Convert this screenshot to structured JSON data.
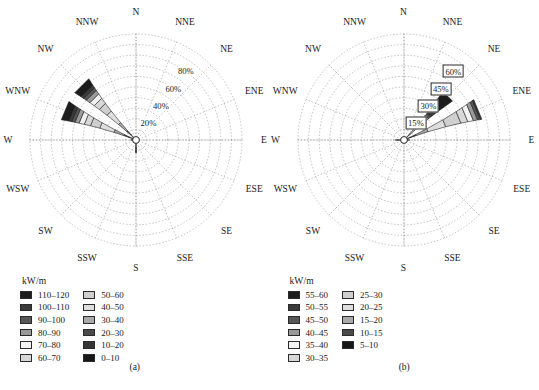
{
  "figure": {
    "panels": [
      {
        "caption": "(a)",
        "legend_title": "kW/m",
        "directions": [
          "N",
          "NNE",
          "NE",
          "ENE",
          "E",
          "ESE",
          "SE",
          "SSE",
          "S",
          "SSW",
          "SW",
          "WSW",
          "W",
          "WNW",
          "NW",
          "NNW"
        ],
        "radial_ticks": [
          "20%",
          "40%",
          "60%",
          "80%"
        ],
        "radial_tick_values": [
          20,
          40,
          60,
          80
        ],
        "radial_max": 100,
        "legend_left": [
          {
            "label": "110–120",
            "color": "#1c1c1c"
          },
          {
            "label": "100–110",
            "color": "#3a3a3a"
          },
          {
            "label": "90–100",
            "color": "#565656"
          },
          {
            "label": "80–90",
            "color": "#9a9a9a"
          },
          {
            "label": "70–80",
            "color": "#f2f2f2"
          },
          {
            "label": "60–70",
            "color": "#d8d8d8"
          }
        ],
        "legend_right": [
          {
            "label": "50–60",
            "color": "#cfcfcf"
          },
          {
            "label": "40–50",
            "color": "#dedede"
          },
          {
            "label": "30–40",
            "color": "#a8a8a8"
          },
          {
            "label": "20–30",
            "color": "#4a4a4a"
          },
          {
            "label": "10–20",
            "color": "#353535"
          },
          {
            "label": "0–10",
            "color": "#171717"
          }
        ]
      },
      {
        "caption": "(b)",
        "legend_title": "kW/m",
        "directions": [
          "N",
          "NNE",
          "NE",
          "ENE",
          "E",
          "ESE",
          "SE",
          "SSE",
          "S",
          "SSW",
          "SW",
          "WSW",
          "W",
          "WNW",
          "NW",
          "NNW"
        ],
        "radial_ticks": [
          "15%",
          "30%",
          "45%",
          "60%"
        ],
        "radial_tick_values": [
          15,
          30,
          45,
          60
        ],
        "radial_max": 75,
        "legend_left": [
          {
            "label": "55–60",
            "color": "#1c1c1c"
          },
          {
            "label": "50–55",
            "color": "#3a3a3a"
          },
          {
            "label": "45–50",
            "color": "#565656"
          },
          {
            "label": "40–45",
            "color": "#9a9a9a"
          },
          {
            "label": "35–40",
            "color": "#f2f2f2"
          },
          {
            "label": "30–35",
            "color": "#d8d8d8"
          }
        ],
        "legend_right": [
          {
            "label": "25–30",
            "color": "#cfcfcf"
          },
          {
            "label": "20–25",
            "color": "#dedede"
          },
          {
            "label": "15–20",
            "color": "#a8a8a8"
          },
          {
            "label": "10–15",
            "color": "#4a4a4a"
          },
          {
            "label": "5–10",
            "color": "#171717"
          }
        ]
      }
    ]
  },
  "chart_data": [
    {
      "type": "windrose",
      "title": "(a)",
      "xlabel": "",
      "ylabel": "",
      "radial_unit": "%",
      "radial_ticks": [
        20,
        40,
        60,
        80
      ],
      "radial_max": 100,
      "legend_title": "kW/m",
      "grid": true,
      "legend_position": "below",
      "categories": [
        "N",
        "NNE",
        "NE",
        "ENE",
        "E",
        "ESE",
        "SE",
        "SSE",
        "S",
        "SSW",
        "SW",
        "WSW",
        "W",
        "WNW",
        "NW",
        "NNW"
      ],
      "bin_labels": [
        "0–10",
        "10–20",
        "20–30",
        "30–40",
        "40–50",
        "50–60",
        "60–70",
        "70–80",
        "80–90",
        "90–100",
        "100–110",
        "110–120"
      ],
      "bin_colors": [
        "#171717",
        "#353535",
        "#4a4a4a",
        "#a8a8a8",
        "#dedede",
        "#cfcfcf",
        "#d8d8d8",
        "#f2f2f2",
        "#9a9a9a",
        "#565656",
        "#3a3a3a",
        "#1c1c1c"
      ],
      "series": [
        {
          "name": "0–10",
          "values": [
            0,
            0,
            0,
            0,
            0,
            0,
            0,
            0,
            8,
            0,
            0,
            2,
            2,
            4,
            4,
            0
          ]
        },
        {
          "name": "10–20",
          "values": [
            0,
            0,
            0,
            0,
            0,
            0,
            0,
            0,
            4,
            0,
            0,
            1,
            1,
            3,
            3,
            0
          ]
        },
        {
          "name": "20–30",
          "values": [
            0,
            0,
            0,
            0,
            0,
            0,
            0,
            0,
            0,
            0,
            0,
            0,
            1,
            5,
            5,
            0
          ]
        },
        {
          "name": "30–40",
          "values": [
            0,
            0,
            0,
            0,
            0,
            0,
            0,
            0,
            0,
            0,
            0,
            0,
            1,
            10,
            10,
            0
          ]
        },
        {
          "name": "40–50",
          "values": [
            0,
            0,
            0,
            0,
            0,
            0,
            0,
            0,
            0,
            0,
            0,
            0,
            0,
            14,
            14,
            0
          ]
        },
        {
          "name": "50–60",
          "values": [
            0,
            0,
            0,
            0,
            0,
            0,
            0,
            0,
            0,
            0,
            0,
            0,
            0,
            9,
            9,
            0
          ]
        },
        {
          "name": "60–70",
          "values": [
            0,
            0,
            0,
            0,
            0,
            0,
            0,
            0,
            0,
            0,
            0,
            0,
            0,
            6,
            6,
            0
          ]
        },
        {
          "name": "70–80",
          "values": [
            0,
            0,
            0,
            0,
            0,
            0,
            0,
            0,
            0,
            0,
            0,
            0,
            0,
            5,
            5,
            0
          ]
        },
        {
          "name": "80–90",
          "values": [
            0,
            0,
            0,
            0,
            0,
            0,
            0,
            0,
            0,
            0,
            0,
            0,
            0,
            4,
            4,
            0
          ]
        },
        {
          "name": "90–100",
          "values": [
            0,
            0,
            0,
            0,
            0,
            0,
            0,
            0,
            0,
            0,
            0,
            0,
            0,
            3,
            3,
            0
          ]
        },
        {
          "name": "100–110",
          "values": [
            0,
            0,
            0,
            0,
            0,
            0,
            0,
            0,
            0,
            0,
            0,
            0,
            0,
            3,
            3,
            0
          ]
        },
        {
          "name": "110–120",
          "values": [
            0,
            0,
            0,
            0,
            0,
            0,
            0,
            0,
            0,
            0,
            0,
            0,
            0,
            7,
            7,
            0
          ]
        }
      ]
    },
    {
      "type": "windrose",
      "title": "(b)",
      "xlabel": "",
      "ylabel": "",
      "radial_unit": "%",
      "radial_ticks": [
        15,
        30,
        45,
        60
      ],
      "radial_max": 75,
      "legend_title": "kW/m",
      "grid": true,
      "legend_position": "below",
      "categories": [
        "N",
        "NNE",
        "NE",
        "ENE",
        "E",
        "ESE",
        "SE",
        "SSE",
        "S",
        "SSW",
        "SW",
        "WSW",
        "W",
        "WNW",
        "NW",
        "NNW"
      ],
      "bin_labels": [
        "5–10",
        "10–15",
        "15–20",
        "20–25",
        "25–30",
        "30–35",
        "35–40",
        "40–45",
        "45–50",
        "50–55",
        "55–60"
      ],
      "bin_colors": [
        "#171717",
        "#4a4a4a",
        "#a8a8a8",
        "#dedede",
        "#cfcfcf",
        "#d8d8d8",
        "#f2f2f2",
        "#9a9a9a",
        "#565656",
        "#3a3a3a",
        "#1c1c1c"
      ],
      "series": [
        {
          "name": "5–10",
          "values": [
            0,
            0,
            3,
            5,
            2,
            0,
            0,
            0,
            0,
            0,
            0,
            0,
            4,
            0,
            0,
            0
          ]
        },
        {
          "name": "10–15",
          "values": [
            0,
            0,
            3,
            4,
            1,
            0,
            0,
            0,
            0,
            0,
            0,
            0,
            2,
            0,
            0,
            0
          ]
        },
        {
          "name": "15–20",
          "values": [
            0,
            0,
            4,
            9,
            1,
            0,
            0,
            0,
            0,
            0,
            0,
            0,
            0,
            0,
            0,
            0
          ]
        },
        {
          "name": "20–25",
          "values": [
            0,
            0,
            4,
            13,
            0,
            0,
            0,
            0,
            0,
            0,
            0,
            0,
            0,
            0,
            0,
            0
          ]
        },
        {
          "name": "25–30",
          "values": [
            0,
            0,
            3,
            11,
            0,
            0,
            0,
            0,
            0,
            0,
            0,
            0,
            0,
            0,
            0,
            0
          ]
        },
        {
          "name": "30–35",
          "values": [
            0,
            0,
            2,
            5,
            0,
            0,
            0,
            0,
            0,
            0,
            0,
            0,
            0,
            0,
            0,
            0
          ]
        },
        {
          "name": "35–40",
          "values": [
            0,
            0,
            2,
            4,
            0,
            0,
            0,
            0,
            0,
            0,
            0,
            0,
            0,
            0,
            0,
            0
          ]
        },
        {
          "name": "40–45",
          "values": [
            0,
            0,
            2,
            3,
            0,
            0,
            0,
            0,
            0,
            0,
            0,
            0,
            0,
            0,
            0,
            0
          ]
        },
        {
          "name": "45–50",
          "values": [
            0,
            0,
            2,
            2,
            0,
            0,
            0,
            0,
            0,
            0,
            0,
            0,
            0,
            0,
            0,
            0
          ]
        },
        {
          "name": "50–55",
          "values": [
            0,
            0,
            6,
            1,
            0,
            0,
            0,
            0,
            0,
            0,
            0,
            0,
            0,
            0,
            0,
            0
          ]
        },
        {
          "name": "55–60",
          "values": [
            0,
            0,
            13,
            0,
            0,
            0,
            0,
            0,
            0,
            0,
            0,
            0,
            0,
            0,
            0,
            0
          ]
        }
      ]
    }
  ]
}
